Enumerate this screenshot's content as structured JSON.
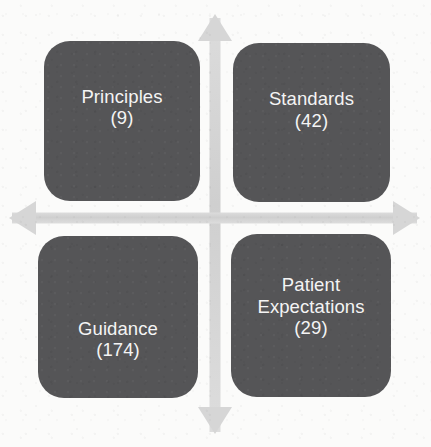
{
  "diagram": {
    "type": "two-by-two-quadrant-matrix",
    "title": "",
    "background_color": "#fbfbfa",
    "box_color": "#555557",
    "box_text_color": "#f4f4f4",
    "axis_color": "#d2d2d2",
    "axes": {
      "name": "four-headed-cross-arrow",
      "center_x": 215,
      "center_y": 218,
      "up_label": "",
      "down_label": "",
      "left_label": "",
      "right_label": ""
    },
    "quadrants": [
      {
        "id": "principles",
        "position": "top-left",
        "label": "Principles",
        "count": 9,
        "count_text": "(9)"
      },
      {
        "id": "standards",
        "position": "top-right",
        "label": "Standards",
        "count": 42,
        "count_text": "(42)"
      },
      {
        "id": "guidance",
        "position": "bottom-left",
        "label": "Guidance",
        "count": 174,
        "count_text": "(174)"
      },
      {
        "id": "patient-expectations",
        "position": "bottom-right",
        "label": "Patient\nExpectations",
        "count": 29,
        "count_text": "(29)"
      }
    ]
  }
}
